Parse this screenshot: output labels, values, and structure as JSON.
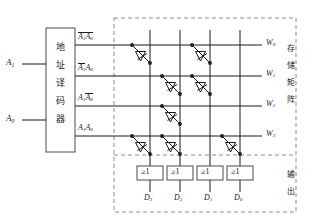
{
  "diagram": {
    "colors": {
      "line": "#1a1a1a",
      "dashed": "#8a8a8a",
      "text": "#1a1a1a",
      "background": "#ffffff"
    }
  },
  "inputs": [
    {
      "name": "address-input-a1",
      "label": "A",
      "sub": "1"
    },
    {
      "name": "address-input-a0",
      "label": "A",
      "sub": "0"
    }
  ],
  "decoder": {
    "name": "address-decoder",
    "label": "地址译码器",
    "chars": [
      "地",
      "址",
      "译",
      "码",
      "器"
    ]
  },
  "minterms": [
    {
      "name": "minterm-row-0",
      "a1_bar": true,
      "a0_bar": true,
      "text": "A1'A0'"
    },
    {
      "name": "minterm-row-1",
      "a1_bar": true,
      "a0_bar": false,
      "text": "A1'A0"
    },
    {
      "name": "minterm-row-2",
      "a1_bar": false,
      "a0_bar": true,
      "text": "A1A0'"
    },
    {
      "name": "minterm-row-3",
      "a1_bar": false,
      "a0_bar": false,
      "text": "A1A0"
    }
  ],
  "word_lines": [
    {
      "name": "word-line-w0",
      "label": "W",
      "sub": "0"
    },
    {
      "name": "word-line-w1",
      "label": "W",
      "sub": "1"
    },
    {
      "name": "word-line-w2",
      "label": "W",
      "sub": "2"
    },
    {
      "name": "word-line-w3",
      "label": "W",
      "sub": "3"
    }
  ],
  "storage_matrix": {
    "name": "storage-matrix",
    "label": "存储矩阵",
    "chars": [
      "存",
      "储",
      "矩",
      "阵"
    ]
  },
  "output_section": {
    "name": "output-section",
    "label": "输出",
    "chars": [
      "输",
      "出"
    ]
  },
  "or_gates": [
    {
      "name": "or-gate-d3",
      "symbol": "≥1"
    },
    {
      "name": "or-gate-d2",
      "symbol": "≥1"
    },
    {
      "name": "or-gate-d1",
      "symbol": "≥1"
    },
    {
      "name": "or-gate-d0",
      "symbol": "≥1"
    }
  ],
  "data_outputs": [
    {
      "name": "data-output-d3",
      "label": "D",
      "sub": "3"
    },
    {
      "name": "data-output-d2",
      "label": "D",
      "sub": "2"
    },
    {
      "name": "data-output-d1",
      "label": "D",
      "sub": "1"
    },
    {
      "name": "data-output-d0",
      "label": "D",
      "sub": "0"
    }
  ],
  "diode_matrix": {
    "description": "Diode present at (word line, bit line) intersections",
    "bit_line_order": [
      "D3",
      "D2",
      "D1",
      "D0"
    ],
    "connections": [
      {
        "word": "W0",
        "bits": [
          "D3",
          "D1"
        ]
      },
      {
        "word": "W1",
        "bits": [
          "D2",
          "D1"
        ]
      },
      {
        "word": "W2",
        "bits": [
          "D2"
        ]
      },
      {
        "word": "W3",
        "bits": [
          "D3",
          "D2",
          "D0"
        ]
      }
    ],
    "truth_table": [
      {
        "word": "W0",
        "D3": 1,
        "D2": 0,
        "D1": 1,
        "D0": 0
      },
      {
        "word": "W1",
        "D3": 0,
        "D2": 1,
        "D1": 1,
        "D0": 0
      },
      {
        "word": "W2",
        "D3": 0,
        "D2": 1,
        "D1": 0,
        "D0": 0
      },
      {
        "word": "W3",
        "D3": 1,
        "D2": 1,
        "D1": 0,
        "D0": 1
      }
    ]
  }
}
